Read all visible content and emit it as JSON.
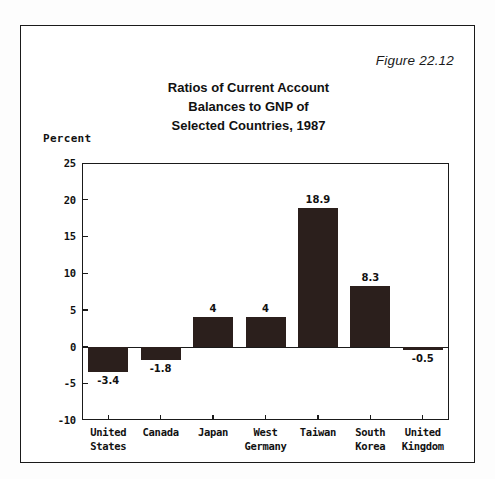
{
  "figure": {
    "number_label": "Figure 22.12",
    "title_lines": [
      "Ratios of Current Account",
      "Balances to GNP of",
      "Selected Countries, 1987"
    ],
    "border_color": "#1a1a1a",
    "bar_color": "#2b1f1c",
    "background_color": "#ffffff"
  },
  "chart_data": {
    "type": "bar",
    "title": "Ratios of Current Account Balances to GNP of Selected Countries, 1987",
    "xlabel": "",
    "ylabel": "Percent",
    "ylim": [
      -10,
      25
    ],
    "yticks": [
      25,
      20,
      15,
      10,
      5,
      0,
      -5,
      -10
    ],
    "ytick_labels": [
      "25",
      "20",
      "15",
      "10",
      "5",
      "0",
      "-5",
      "-10"
    ],
    "grid": false,
    "legend": "none",
    "categories": [
      "United States",
      "Canada",
      "Japan",
      "West Germany",
      "Taiwan",
      "South Korea",
      "United Kingdom"
    ],
    "category_label_lines": [
      [
        "United",
        "States"
      ],
      [
        "Canada",
        ""
      ],
      [
        "Japan",
        ""
      ],
      [
        "West",
        "Germany"
      ],
      [
        "Taiwan",
        ""
      ],
      [
        "South",
        "Korea"
      ],
      [
        "United",
        "Kingdom"
      ]
    ],
    "values": [
      -3.4,
      -1.8,
      4,
      4,
      18.9,
      8.3,
      -0.5
    ],
    "value_labels": [
      "-3.4",
      "-1.8",
      "4",
      "4",
      "18.9",
      "8.3",
      "-0.5"
    ]
  }
}
